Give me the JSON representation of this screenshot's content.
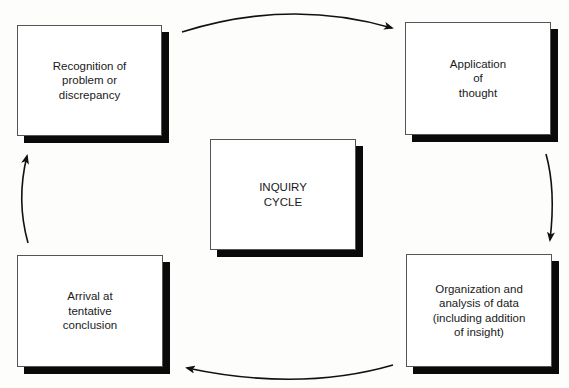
{
  "diagram": {
    "type": "cycle",
    "center": {
      "label": "INQUIRY\nCYCLE"
    },
    "nodes": [
      {
        "id": "recognition",
        "label": "Recognition of\nproblem or\ndiscrepancy"
      },
      {
        "id": "application",
        "label": "Application\nof\nthought"
      },
      {
        "id": "organization",
        "label": "Organization and\nanalysis of data\n(including addition\nof insight)"
      },
      {
        "id": "arrival",
        "label": "Arrival at\ntentative\nconclusion"
      }
    ],
    "edges": [
      {
        "from": "recognition",
        "to": "application"
      },
      {
        "from": "application",
        "to": "organization"
      },
      {
        "from": "organization",
        "to": "arrival"
      },
      {
        "from": "arrival",
        "to": "recognition"
      }
    ],
    "colors": {
      "box_fill": "#ffffff",
      "shadow": "#0a0a0a",
      "arrow": "#111111",
      "background": "#fdfdfc"
    }
  }
}
